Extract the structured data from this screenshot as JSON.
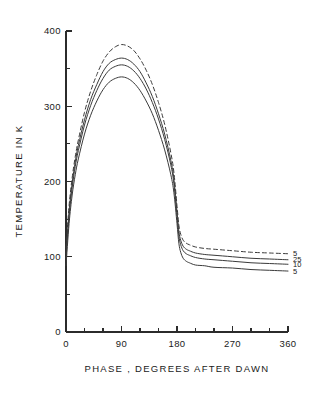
{
  "chart_data": {
    "type": "line",
    "title": "",
    "xlabel": "PHASE , DEGREES AFTER DAWN",
    "ylabel": "TEMPERATURE IN K",
    "xlim": [
      0,
      360
    ],
    "ylim": [
      0,
      400
    ],
    "xticks": [
      0,
      90,
      180,
      270,
      360
    ],
    "xticklabels": [
      "0",
      "90",
      "180",
      "270",
      "360"
    ],
    "yticks": [
      0,
      100,
      200,
      300,
      400
    ],
    "yticklabels": [
      "0",
      "100",
      "200",
      "300",
      "400"
    ],
    "x_minor_tick_interval": 30,
    "y_minor_tick_interval": 50,
    "grid": false,
    "legend_position": "right-inline-end-labels",
    "series": [
      {
        "name": "5",
        "label": "5",
        "style": "dashed",
        "peak_value": 382,
        "peak_phase": 90,
        "dawn_value": 112,
        "night_end_value": 104,
        "x": [
          0,
          5,
          10,
          15,
          20,
          30,
          40,
          50,
          60,
          70,
          80,
          90,
          100,
          110,
          120,
          130,
          140,
          150,
          160,
          170,
          175,
          180,
          183,
          186,
          190,
          195,
          200,
          210,
          225,
          240,
          270,
          300,
          330,
          360
        ],
        "y": [
          112,
          168,
          205,
          233,
          255,
          292,
          320,
          342,
          360,
          372,
          379,
          382,
          380,
          374,
          363,
          348,
          329,
          305,
          276,
          238,
          212,
          168,
          142,
          130,
          122,
          118,
          116,
          113,
          111,
          110,
          108,
          106,
          105,
          104
        ]
      },
      {
        "name": "25",
        "label": "25",
        "style": "solid",
        "peak_value": 364,
        "peak_phase": 90,
        "dawn_value": 104,
        "night_end_value": 96,
        "x": [
          0,
          5,
          10,
          15,
          20,
          30,
          40,
          50,
          60,
          70,
          80,
          90,
          100,
          110,
          120,
          130,
          140,
          150,
          160,
          170,
          175,
          180,
          183,
          186,
          190,
          195,
          200,
          210,
          225,
          240,
          270,
          300,
          330,
          360
        ],
        "y": [
          104,
          160,
          198,
          226,
          248,
          282,
          309,
          329,
          346,
          357,
          362,
          364,
          362,
          356,
          346,
          331,
          313,
          290,
          263,
          228,
          203,
          160,
          134,
          122,
          114,
          110,
          108,
          105,
          103,
          102,
          100,
          98,
          97,
          96
        ]
      },
      {
        "name": "10",
        "label": "10",
        "style": "solid",
        "peak_value": 355,
        "peak_phase": 90,
        "dawn_value": 98,
        "night_end_value": 90,
        "x": [
          0,
          5,
          10,
          15,
          20,
          30,
          40,
          50,
          60,
          70,
          80,
          90,
          100,
          110,
          120,
          130,
          140,
          150,
          160,
          170,
          175,
          180,
          183,
          186,
          190,
          195,
          200,
          210,
          225,
          240,
          270,
          300,
          330,
          360
        ],
        "y": [
          98,
          154,
          192,
          220,
          241,
          275,
          301,
          321,
          337,
          348,
          353,
          355,
          353,
          347,
          337,
          323,
          305,
          283,
          256,
          222,
          197,
          154,
          128,
          116,
          108,
          104,
          102,
          99,
          97,
          96,
          94,
          92,
          91,
          90
        ]
      },
      {
        "name": "5",
        "label": "5",
        "style": "solid",
        "peak_value": 339,
        "peak_phase": 90,
        "dawn_value": 88,
        "night_end_value": 81,
        "x": [
          0,
          5,
          10,
          15,
          20,
          30,
          40,
          50,
          60,
          70,
          80,
          90,
          100,
          110,
          120,
          130,
          140,
          150,
          160,
          170,
          175,
          180,
          183,
          186,
          190,
          195,
          200,
          210,
          225,
          240,
          270,
          300,
          330,
          360
        ],
        "y": [
          88,
          144,
          182,
          209,
          230,
          263,
          288,
          307,
          322,
          332,
          337,
          339,
          337,
          331,
          321,
          307,
          290,
          268,
          242,
          209,
          185,
          144,
          118,
          106,
          98,
          94,
          92,
          89,
          88,
          86,
          85,
          83,
          82,
          81
        ]
      }
    ],
    "end_labels": [
      {
        "text": "5",
        "value": 104
      },
      {
        "text": "25",
        "value": 96
      },
      {
        "text": "10",
        "value": 90
      },
      {
        "text": "5",
        "value": 81
      }
    ]
  }
}
